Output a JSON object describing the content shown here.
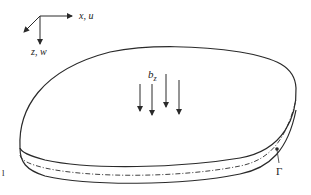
{
  "diagram": {
    "type": "plate-body-force-schematic",
    "axes": {
      "x_label": "x, u",
      "z_label": "z, w"
    },
    "load": {
      "label": "b",
      "subscript": "z",
      "arrow_count": 4
    },
    "boundary": {
      "label": "Γ"
    },
    "left_mark": "l",
    "colors": {
      "stroke": "#2a2a2a",
      "background": "#ffffff"
    }
  }
}
